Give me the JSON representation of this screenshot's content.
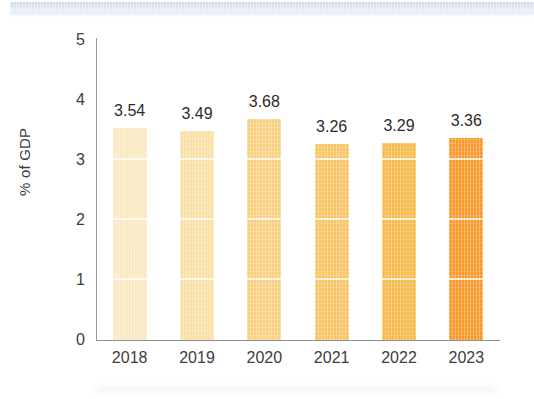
{
  "chart_data": {
    "type": "bar",
    "title": "",
    "xlabel": "",
    "ylabel": "% of GDP",
    "ylim": [
      0,
      5
    ],
    "yticks": [
      "0",
      "1",
      "2",
      "3",
      "4",
      "5"
    ],
    "grid": "horizontal-white-over-bars",
    "legend": "none",
    "categories": [
      "2018",
      "2019",
      "2020",
      "2021",
      "2022",
      "2023"
    ],
    "values": [
      3.54,
      3.49,
      3.68,
      3.26,
      3.29,
      3.36
    ],
    "value_labels": [
      "3.54",
      "3.49",
      "3.68",
      "3.26",
      "3.29",
      "3.36"
    ],
    "bar_colors": [
      "#FAE8C0",
      "#F9DFA4",
      "#F9D080",
      "#F8C565",
      "#F7B94A",
      "#F8992A"
    ]
  },
  "decor": {
    "top_band_color": "#cdd9ee"
  }
}
